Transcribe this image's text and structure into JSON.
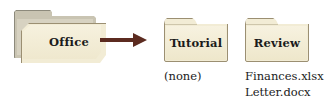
{
  "diagram": {
    "colors": {
      "background": "#ffffff",
      "folder_fill": "#f2ecd5",
      "folder_outline": "#9b8f72",
      "open_folder_back": "#c9c4b2",
      "arrow": "#5c2b20",
      "text": "#1b1b1b"
    },
    "parent_folder": {
      "label": "Office",
      "type": "open-folder",
      "icon": "open-folder-icon"
    },
    "arrow": {
      "icon": "arrow-right-icon",
      "direction": "right"
    },
    "child_folders": [
      {
        "label": "Tutorial",
        "icon": "folder-icon",
        "contents": [
          "(none)"
        ]
      },
      {
        "label": "Review",
        "icon": "folder-icon",
        "contents": [
          "Finances.xlsx",
          "Letter.docx"
        ]
      }
    ]
  }
}
